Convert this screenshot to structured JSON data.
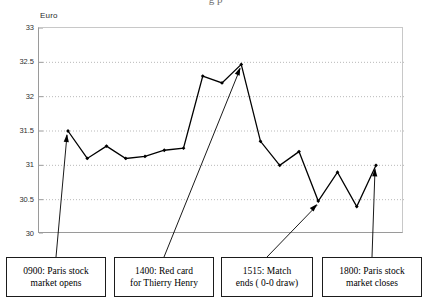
{
  "figure": {
    "title_cropped": "g  p",
    "y_axis_label": "Euro"
  },
  "chart_data": {
    "type": "line",
    "title": "",
    "xlabel": "",
    "ylabel": "Euro",
    "ylim": [
      30,
      33
    ],
    "xlim": [
      0,
      17
    ],
    "yticks": [
      33,
      32.5,
      32,
      31.5,
      31,
      30.5,
      30
    ],
    "ytick_labels": [
      "33",
      "32.5",
      "32",
      "31.5",
      "31",
      "30.5",
      "30"
    ],
    "grid": "horizontal-dotted",
    "legend": "none",
    "marker": "diamond",
    "line_color": "#000000",
    "x": [
      1,
      2,
      3,
      4,
      5,
      6,
      7,
      8,
      9,
      10,
      11,
      12,
      13,
      14,
      15,
      16,
      17
    ],
    "values": [
      31.5,
      31.1,
      31.28,
      31.1,
      31.13,
      31.22,
      31.25,
      32.3,
      32.2,
      32.47,
      31.35,
      31.0,
      31.2,
      30.48,
      30.9,
      30.4,
      31.0
    ],
    "annotations": [
      {
        "label": "0900: Paris stock market opens",
        "line1": "0900: Paris stock",
        "line2": "market opens",
        "points_to_index": 0,
        "points_to_value": 31.5
      },
      {
        "label": "1400: Red card for Thierry Henry",
        "line1": "1400: Red card",
        "line2": "for Thierry Henry",
        "points_to_index": 9,
        "points_to_value": 32.47
      },
      {
        "label": "1515: Match ends ( 0-0 draw)",
        "line1": "1515: Match",
        "line2": "ends ( 0-0 draw)",
        "points_to_index": 13,
        "points_to_value": 30.48
      },
      {
        "label": "1800: Paris stock market closes",
        "line1": "1800: Paris stock",
        "line2": "market closes",
        "points_to_index": 16,
        "points_to_value": 31.0
      }
    ]
  },
  "callouts": [
    {
      "line1": "0900: Paris stock",
      "line2": "market opens"
    },
    {
      "line1": "1400: Red card",
      "line2": "for Thierry Henry"
    },
    {
      "line1": "1515: Match",
      "line2": "ends ( 0-0 draw)"
    },
    {
      "line1": "1800: Paris stock",
      "line2": "market closes"
    }
  ],
  "colors": {
    "series": "#000000",
    "grid": "#b9b9b9",
    "axis": "#9a9a9a",
    "frame": "#c8c8c8",
    "box_border": "#1b1b1b",
    "background": "#ffffff"
  }
}
